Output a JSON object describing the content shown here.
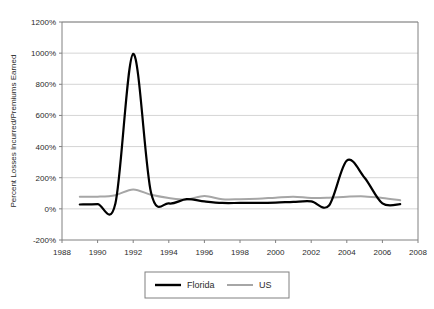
{
  "chart_data": {
    "type": "line",
    "title": "",
    "xlabel": "",
    "ylabel": "Percent Losses Incurred/Premiums Earned",
    "xlim": [
      1988,
      2008
    ],
    "ylim": [
      -200,
      1200
    ],
    "x_tick_labels": [
      "1988",
      "1990",
      "1992",
      "1994",
      "1996",
      "1998",
      "2000",
      "2002",
      "2004",
      "2006",
      "2008"
    ],
    "x_ticks": [
      1988,
      1990,
      1992,
      1994,
      1996,
      1998,
      2000,
      2002,
      2004,
      2006,
      2008
    ],
    "y_tick_labels": [
      "1200%",
      "1000%",
      "800%",
      "600%",
      "400%",
      "200%",
      "0%",
      "-200%"
    ],
    "y_ticks": [
      1200,
      1000,
      800,
      600,
      400,
      200,
      0,
      -200
    ],
    "grid": "horizontal",
    "legend_position": "bottom-center",
    "x": [
      1989,
      1990,
      1991,
      1992,
      1993,
      1994,
      1995,
      1996,
      1997,
      1998,
      1999,
      2000,
      2001,
      2002,
      2003,
      2004,
      2005,
      2006,
      2007
    ],
    "series": [
      {
        "name": "Florida",
        "color": "#000000",
        "width": 2.2,
        "values": [
          28,
          30,
          35,
          995,
          105,
          35,
          62,
          48,
          38,
          38,
          38,
          40,
          45,
          48,
          22,
          310,
          200,
          35,
          30
        ]
      },
      {
        "name": "US",
        "color": "#a6a6a6",
        "width": 2.0,
        "values": [
          78,
          78,
          88,
          125,
          90,
          70,
          60,
          82,
          62,
          62,
          65,
          72,
          78,
          70,
          72,
          78,
          80,
          70,
          55
        ]
      }
    ]
  },
  "legend": {
    "items": [
      {
        "label": "Florida",
        "color": "#000000"
      },
      {
        "label": "US",
        "color": "#a6a6a6"
      }
    ]
  },
  "colors": {
    "florida": "#000000",
    "us": "#a6a6a6",
    "grid": "#c9c9c9",
    "frame": "#808080",
    "text": "#2b2b2b"
  }
}
